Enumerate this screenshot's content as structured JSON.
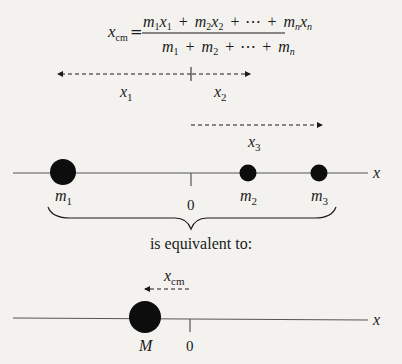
{
  "formula": {
    "lhs": "x",
    "lhs_sub": "cm",
    "equals": "=",
    "numerator": [
      {
        "m": "m",
        "ms": "1",
        "x": "x",
        "xs": "1"
      },
      {
        "m": "m",
        "ms": "2",
        "x": "x",
        "xs": "2"
      },
      {
        "m": "m",
        "ms": "n",
        "x": "x",
        "xs": "n"
      }
    ],
    "denominator": [
      {
        "m": "m",
        "ms": "1"
      },
      {
        "m": "m",
        "ms": "2"
      },
      {
        "m": "m",
        "ms": "n"
      }
    ],
    "plus": "+",
    "ellipsis": "⋯"
  },
  "top_diagram": {
    "vectors": [
      {
        "label": "x",
        "sub": "1",
        "direction": "left"
      },
      {
        "label": "x",
        "sub": "2",
        "direction": "right"
      },
      {
        "label": "x",
        "sub": "3",
        "direction": "right"
      }
    ],
    "axis_label": "x",
    "origin_label": "0",
    "masses": [
      {
        "label": "m",
        "sub": "1",
        "size": "large"
      },
      {
        "label": "m",
        "sub": "2",
        "size": "small"
      },
      {
        "label": "m",
        "sub": "3",
        "size": "small"
      }
    ]
  },
  "caption": "is equivalent to:",
  "bottom_diagram": {
    "vector": {
      "label": "x",
      "sub": "cm",
      "direction": "left"
    },
    "axis_label": "x",
    "origin_label": "0",
    "mass": {
      "label": "M",
      "size": "large"
    }
  },
  "colors": {
    "ink": "#1a1a1a",
    "axis": "#555555",
    "background": "#f3f2ef"
  }
}
